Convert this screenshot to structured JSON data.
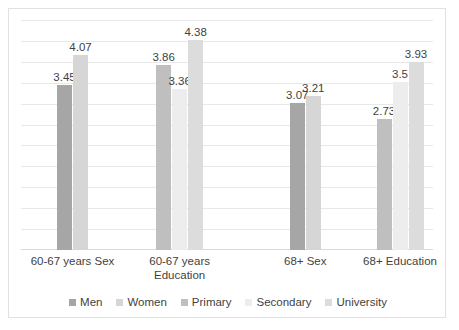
{
  "chart_data": {
    "type": "bar",
    "title": "",
    "subtitle": "",
    "xlabel": "",
    "ylabel": "",
    "ylim": [
      0,
      4.8
    ],
    "grid": true,
    "gridline_count": 11,
    "y_tick_labels_visible": false,
    "legend_position": "bottom",
    "categories": [
      "60-67 years Sex",
      "60-67 years Education",
      "68+ Sex",
      "68+ Education"
    ],
    "category_lines": [
      [
        "60-67 years Sex"
      ],
      [
        "60-67 years",
        "Education"
      ],
      [
        "68+ Sex"
      ],
      [
        "68+ Education"
      ]
    ],
    "legend": [
      {
        "name": "Men",
        "color": "#a6a6a6"
      },
      {
        "name": "Women",
        "color": "#d6d6d6"
      },
      {
        "name": "Primary",
        "color": "#bfbfbf"
      },
      {
        "name": "Secondary",
        "color": "#ededed"
      },
      {
        "name": "University",
        "color": "#dcdcdc"
      }
    ],
    "series": [
      {
        "name": "Men",
        "color": "#a6a6a6",
        "values": [
          3.45,
          null,
          3.07,
          null
        ]
      },
      {
        "name": "Women",
        "color": "#d6d6d6",
        "values": [
          4.07,
          null,
          3.21,
          null
        ]
      },
      {
        "name": "Primary",
        "color": "#bfbfbf",
        "values": [
          null,
          3.86,
          null,
          2.73
        ]
      },
      {
        "name": "Secondary",
        "color": "#ededed",
        "values": [
          null,
          3.36,
          null,
          3.5
        ]
      },
      {
        "name": "University",
        "color": "#dcdcdc",
        "values": [
          null,
          4.38,
          null,
          3.93
        ]
      }
    ],
    "groups": [
      {
        "category": "60-67 years Sex",
        "bars": [
          {
            "series": "Men",
            "value": 3.45,
            "label": "3.45",
            "color": "#a6a6a6"
          },
          {
            "series": "Women",
            "value": 4.07,
            "label": "4.07",
            "color": "#d6d6d6"
          }
        ]
      },
      {
        "category": "60-67 years Education",
        "bars": [
          {
            "series": "Primary",
            "value": 3.86,
            "label": "3.86",
            "color": "#bfbfbf"
          },
          {
            "series": "Secondary",
            "value": 3.36,
            "label": "3.36",
            "color": "#ededed"
          },
          {
            "series": "University",
            "value": 4.38,
            "label": "4.38",
            "color": "#dcdcdc"
          }
        ]
      },
      {
        "category": "68+ Sex",
        "bars": [
          {
            "series": "Men",
            "value": 3.07,
            "label": "3.07",
            "color": "#a6a6a6"
          },
          {
            "series": "Women",
            "value": 3.21,
            "label": "3.21",
            "color": "#d6d6d6"
          }
        ]
      },
      {
        "category": "68+ Education",
        "bars": [
          {
            "series": "Primary",
            "value": 2.73,
            "label": "2.73",
            "color": "#bfbfbf"
          },
          {
            "series": "Secondary",
            "value": 3.5,
            "label": "3.5",
            "color": "#ededed"
          },
          {
            "series": "University",
            "value": 3.93,
            "label": "3.93",
            "color": "#dcdcdc"
          }
        ]
      }
    ]
  },
  "layout": {
    "group_centers_pct": [
      12.5,
      38.5,
      69.0,
      92.0
    ],
    "label_centers_pct": [
      12.5,
      38.5,
      69.0,
      92.0
    ],
    "gridline_color": "#e8e8e8",
    "border_color": "#e2e2e2",
    "text_color": "#3f3f3f"
  }
}
